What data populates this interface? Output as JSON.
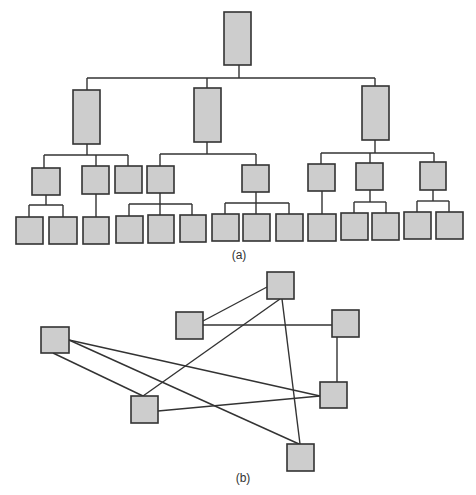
{
  "colors": {
    "box_fill": "#cdcdcd",
    "stroke": "#333333",
    "background": "#ffffff"
  },
  "figure_a": {
    "caption": "(a)",
    "caption_pos": [
      239,
      248
    ],
    "type": "hierarchy-tree",
    "boxes": [
      {
        "id": "root",
        "x": 224,
        "y": 12,
        "w": 27,
        "h": 53
      },
      {
        "id": "L1-left",
        "x": 73,
        "y": 90,
        "w": 27,
        "h": 54
      },
      {
        "id": "L1-mid",
        "x": 194,
        "y": 88,
        "w": 27,
        "h": 54
      },
      {
        "id": "L1-right",
        "x": 362,
        "y": 86,
        "w": 27,
        "h": 54
      },
      {
        "id": "L2-a",
        "x": 32,
        "y": 168,
        "w": 28,
        "h": 27
      },
      {
        "id": "L2-b",
        "x": 82,
        "y": 166,
        "w": 27,
        "h": 28
      },
      {
        "id": "L2-c",
        "x": 115,
        "y": 166,
        "w": 27,
        "h": 27
      },
      {
        "id": "L2-d",
        "x": 147,
        "y": 166,
        "w": 27,
        "h": 27
      },
      {
        "id": "L2-e",
        "x": 242,
        "y": 165,
        "w": 27,
        "h": 27
      },
      {
        "id": "L2-f",
        "x": 308,
        "y": 164,
        "w": 27,
        "h": 27
      },
      {
        "id": "L2-g",
        "x": 356,
        "y": 163,
        "w": 27,
        "h": 27
      },
      {
        "id": "L2-h",
        "x": 420,
        "y": 162,
        "w": 26,
        "h": 28
      },
      {
        "id": "L3-1",
        "x": 16,
        "y": 217,
        "w": 27,
        "h": 27
      },
      {
        "id": "L3-2",
        "x": 49,
        "y": 217,
        "w": 28,
        "h": 27
      },
      {
        "id": "L3-3",
        "x": 83,
        "y": 217,
        "w": 26,
        "h": 27
      },
      {
        "id": "L3-4",
        "x": 116,
        "y": 216,
        "w": 27,
        "h": 27
      },
      {
        "id": "L3-5",
        "x": 148,
        "y": 215,
        "w": 26,
        "h": 28
      },
      {
        "id": "L3-6",
        "x": 180,
        "y": 215,
        "w": 26,
        "h": 27
      },
      {
        "id": "L3-7",
        "x": 212,
        "y": 214,
        "w": 27,
        "h": 27
      },
      {
        "id": "L3-8",
        "x": 243,
        "y": 214,
        "w": 27,
        "h": 27
      },
      {
        "id": "L3-9",
        "x": 276,
        "y": 214,
        "w": 27,
        "h": 27
      },
      {
        "id": "L3-10",
        "x": 308,
        "y": 214,
        "w": 28,
        "h": 27
      },
      {
        "id": "L3-11",
        "x": 341,
        "y": 213,
        "w": 27,
        "h": 27
      },
      {
        "id": "L3-12",
        "x": 372,
        "y": 213,
        "w": 27,
        "h": 27
      },
      {
        "id": "L3-13",
        "x": 404,
        "y": 212,
        "w": 27,
        "h": 27
      },
      {
        "id": "L3-14",
        "x": 436,
        "y": 212,
        "w": 27,
        "h": 27
      }
    ],
    "lines": [
      [
        239,
        65,
        239,
        78
      ],
      [
        87,
        78,
        375,
        78
      ],
      [
        87,
        78,
        87,
        90
      ],
      [
        207,
        78,
        207,
        88
      ],
      [
        375,
        78,
        375,
        86
      ],
      [
        87,
        144,
        87,
        155
      ],
      [
        44,
        155,
        128,
        155
      ],
      [
        44,
        155,
        44,
        168
      ],
      [
        96,
        155,
        96,
        166
      ],
      [
        128,
        155,
        128,
        166
      ],
      [
        207,
        142,
        207,
        154
      ],
      [
        160,
        154,
        256,
        154
      ],
      [
        160,
        154,
        160,
        166
      ],
      [
        256,
        154,
        256,
        165
      ],
      [
        375,
        140,
        375,
        153
      ],
      [
        321,
        153,
        434,
        153
      ],
      [
        321,
        153,
        321,
        164
      ],
      [
        370,
        153,
        370,
        163
      ],
      [
        434,
        153,
        434,
        162
      ],
      [
        46,
        195,
        46,
        205
      ],
      [
        29,
        205,
        63,
        205
      ],
      [
        29,
        205,
        29,
        217
      ],
      [
        63,
        205,
        63,
        217
      ],
      [
        96,
        194,
        96,
        217
      ],
      [
        160,
        193,
        160,
        204
      ],
      [
        129,
        204,
        192,
        204
      ],
      [
        129,
        204,
        129,
        216
      ],
      [
        160,
        204,
        160,
        215
      ],
      [
        192,
        204,
        192,
        215
      ],
      [
        256,
        192,
        256,
        203
      ],
      [
        225,
        203,
        289,
        203
      ],
      [
        225,
        203,
        225,
        214
      ],
      [
        256,
        203,
        256,
        214
      ],
      [
        289,
        203,
        289,
        214
      ],
      [
        322,
        191,
        322,
        214
      ],
      [
        370,
        190,
        370,
        202
      ],
      [
        354,
        202,
        386,
        202
      ],
      [
        354,
        202,
        354,
        213
      ],
      [
        386,
        202,
        386,
        213
      ],
      [
        433,
        190,
        433,
        201
      ],
      [
        417,
        201,
        449,
        201
      ],
      [
        417,
        201,
        417,
        212
      ],
      [
        449,
        201,
        449,
        212
      ]
    ]
  },
  "figure_b": {
    "caption": "(b)",
    "caption_pos": [
      243,
      471
    ],
    "type": "network-graph",
    "nodes": [
      {
        "id": "N1",
        "x": 267,
        "y": 272,
        "w": 27,
        "h": 27
      },
      {
        "id": "N2",
        "x": 176,
        "y": 312,
        "w": 27,
        "h": 27
      },
      {
        "id": "N3",
        "x": 332,
        "y": 310,
        "w": 27,
        "h": 27
      },
      {
        "id": "N4",
        "x": 41,
        "y": 327,
        "w": 28,
        "h": 26
      },
      {
        "id": "N5",
        "x": 320,
        "y": 382,
        "w": 27,
        "h": 26
      },
      {
        "id": "N6",
        "x": 131,
        "y": 396,
        "w": 27,
        "h": 27
      },
      {
        "id": "N7",
        "x": 287,
        "y": 444,
        "w": 27,
        "h": 27
      }
    ],
    "edges": [
      {
        "from": "N2",
        "to": "N1",
        "line": [
          203,
          321,
          267,
          287
        ]
      },
      {
        "from": "N2",
        "to": "N3",
        "line": [
          203,
          325,
          332,
          325
        ]
      },
      {
        "from": "N1",
        "to": "N6",
        "line": [
          280,
          299,
          143,
          396
        ]
      },
      {
        "from": "N1",
        "to": "N7",
        "line": [
          282,
          299,
          300,
          444
        ]
      },
      {
        "from": "N3",
        "to": "N5",
        "line": [
          337,
          337,
          337,
          382
        ]
      },
      {
        "from": "N4",
        "to": "N5",
        "line": [
          69,
          340,
          320,
          396
        ]
      },
      {
        "from": "N4",
        "to": "N7",
        "line": [
          69,
          340,
          299,
          444
        ]
      },
      {
        "from": "N4",
        "to": "N6",
        "line": [
          53,
          353,
          143,
          396
        ]
      },
      {
        "from": "N6",
        "to": "N5",
        "line": [
          158,
          411,
          320,
          396
        ]
      }
    ]
  }
}
